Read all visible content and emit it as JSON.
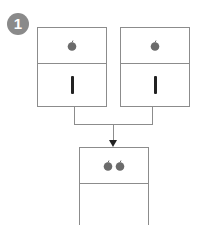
{
  "step": {
    "number": "1"
  },
  "inputs": [
    {
      "apples": 1,
      "tally": "|"
    },
    {
      "apples": 1,
      "tally": "|"
    }
  ],
  "output": {
    "apples": 2,
    "tally": ""
  },
  "colors": {
    "stroke": "#8c8c8c",
    "apple": "#6b6b6b",
    "badge": "#8a8a8a",
    "tally": "#222222"
  }
}
